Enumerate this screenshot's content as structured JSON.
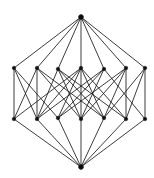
{
  "figure": {
    "kind": "lattice-hasse-diagram",
    "background_color": "#ffffff",
    "edge_color": "#1a1a1a",
    "vertex_color": "#111111",
    "canvas": {
      "width": 154,
      "height": 178
    },
    "counts": {
      "vertices": 14,
      "edges": 44,
      "rank_sizes": "1, 6, 6, 1"
    }
  },
  "chart_data": {
    "type": "scatter",
    "xlabel": "",
    "ylabel": "",
    "xlim": [
      0,
      154
    ],
    "ylim": [
      0,
      178
    ],
    "grid": false,
    "legend": "none",
    "nodes": [
      {
        "id": "top",
        "x": 81,
        "y": 17,
        "rank": 3,
        "r": 2.3
      },
      {
        "id": "u0",
        "x": 14,
        "y": 68,
        "rank": 2,
        "r": 1.8
      },
      {
        "id": "u1",
        "x": 37,
        "y": 68,
        "rank": 2,
        "r": 1.8
      },
      {
        "id": "u2",
        "x": 58,
        "y": 69,
        "rank": 2,
        "r": 1.8
      },
      {
        "id": "u3",
        "x": 81,
        "y": 68,
        "rank": 2,
        "r": 1.8
      },
      {
        "id": "u4",
        "x": 104,
        "y": 69,
        "rank": 2,
        "r": 1.8
      },
      {
        "id": "u5",
        "x": 126,
        "y": 68,
        "rank": 2,
        "r": 1.8
      },
      {
        "id": "u6",
        "x": 145,
        "y": 68,
        "rank": 2,
        "r": 1.8
      },
      {
        "id": "l0",
        "x": 14,
        "y": 119,
        "rank": 1,
        "r": 1.8
      },
      {
        "id": "l1",
        "x": 37,
        "y": 119,
        "rank": 1,
        "r": 1.8
      },
      {
        "id": "l2",
        "x": 58,
        "y": 118,
        "rank": 1,
        "r": 1.8
      },
      {
        "id": "l3",
        "x": 81,
        "y": 119,
        "rank": 1,
        "r": 1.8
      },
      {
        "id": "l4",
        "x": 104,
        "y": 118,
        "rank": 1,
        "r": 1.8
      },
      {
        "id": "l5",
        "x": 126,
        "y": 119,
        "rank": 1,
        "r": 1.8
      },
      {
        "id": "l6",
        "x": 145,
        "y": 119,
        "rank": 1,
        "r": 1.8
      },
      {
        "id": "bot",
        "x": 81,
        "y": 167,
        "rank": 0,
        "r": 2.3
      }
    ],
    "edges": [
      [
        "top",
        "u0"
      ],
      [
        "top",
        "u1"
      ],
      [
        "top",
        "u2"
      ],
      [
        "top",
        "u3"
      ],
      [
        "top",
        "u4"
      ],
      [
        "top",
        "u5"
      ],
      [
        "top",
        "u6"
      ],
      [
        "u0",
        "l0"
      ],
      [
        "u1",
        "l1"
      ],
      [
        "u3",
        "l3"
      ],
      [
        "u5",
        "l5"
      ],
      [
        "u6",
        "l6"
      ],
      [
        "u0",
        "l1"
      ],
      [
        "u0",
        "l2"
      ],
      [
        "u1",
        "l0"
      ],
      [
        "u1",
        "l3"
      ],
      [
        "u1",
        "l4"
      ],
      [
        "u2",
        "l1"
      ],
      [
        "u2",
        "l3"
      ],
      [
        "u2",
        "l5"
      ],
      [
        "u3",
        "l0"
      ],
      [
        "u3",
        "l2"
      ],
      [
        "u3",
        "l4"
      ],
      [
        "u4",
        "l1"
      ],
      [
        "u4",
        "l3"
      ],
      [
        "u4",
        "l6"
      ],
      [
        "u5",
        "l2"
      ],
      [
        "u5",
        "l4"
      ],
      [
        "u5",
        "l3"
      ],
      [
        "u6",
        "l4"
      ],
      [
        "u6",
        "l5"
      ],
      [
        "u2",
        "l4"
      ],
      [
        "u4",
        "l2"
      ],
      [
        "u3",
        "l5"
      ],
      [
        "u3",
        "l1"
      ],
      [
        "l0",
        "bot"
      ],
      [
        "l1",
        "bot"
      ],
      [
        "l2",
        "bot"
      ],
      [
        "l3",
        "bot"
      ],
      [
        "l4",
        "bot"
      ],
      [
        "l5",
        "bot"
      ],
      [
        "l6",
        "bot"
      ]
    ],
    "vertical_edges": [
      [
        "u0",
        "l0"
      ],
      [
        "u1",
        "l1"
      ],
      [
        "u3",
        "l3"
      ],
      [
        "u5",
        "l5"
      ],
      [
        "u6",
        "l6"
      ]
    ]
  }
}
